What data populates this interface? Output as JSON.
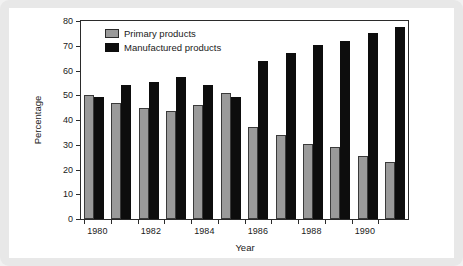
{
  "chart_data": {
    "type": "bar",
    "title": "",
    "xlabel": "Year",
    "ylabel": "Percentage",
    "ylim": [
      0,
      80
    ],
    "yticks": [
      0,
      10,
      20,
      30,
      40,
      50,
      60,
      70,
      80
    ],
    "ytick_labels": [
      "0",
      "10",
      "20",
      "30",
      "40",
      "50",
      "60",
      "70",
      "80"
    ],
    "grid": false,
    "legend_position": "top-left",
    "categories": [
      "1980",
      "1981",
      "1982",
      "1983",
      "1984",
      "1985",
      "1986",
      "1987",
      "1988",
      "1989",
      "1990",
      "1991"
    ],
    "xtick_labels": [
      "1980",
      "1982",
      "1984",
      "1986",
      "1988",
      "1990"
    ],
    "series": [
      {
        "name": "Primary products",
        "color": "#9a9a9a",
        "values": [
          50,
          47,
          45,
          43.5,
          46,
          51,
          37,
          34,
          30.5,
          29,
          25.5,
          23
        ]
      },
      {
        "name": "Manufactured products",
        "color": "#0d0d0d",
        "values": [
          49.5,
          54,
          55.5,
          57.5,
          54,
          49.5,
          64,
          67,
          70.5,
          72,
          75,
          77.5
        ]
      }
    ]
  },
  "colors": {
    "primary_bar": "#9a9a9a",
    "manufactured_bar": "#0d0d0d",
    "axis": "#2b2b2b",
    "page_background": "#e8e8e8",
    "plot_background": "#ffffff"
  }
}
